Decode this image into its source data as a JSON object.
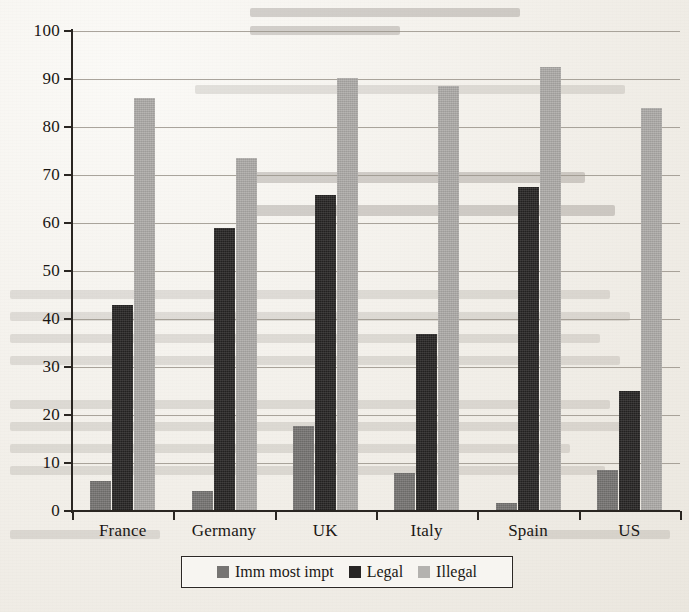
{
  "chart_data": {
    "type": "bar",
    "title": "",
    "subtitle": "",
    "xlabel": "",
    "ylabel": "",
    "categories": [
      "France",
      "Germany",
      "UK",
      "Italy",
      "Spain",
      "US"
    ],
    "series": [
      {
        "name": "Imm most impt",
        "color": "#767472",
        "values": [
          6.3,
          4.2,
          17.7,
          8.0,
          1.7,
          8.5
        ]
      },
      {
        "name": "Legal",
        "color": "#272524",
        "values": [
          43.0,
          59.0,
          65.8,
          36.8,
          67.5,
          25.0
        ]
      },
      {
        "name": "Illegal",
        "color": "#adaba8",
        "values": [
          86.0,
          73.5,
          90.2,
          88.5,
          92.5,
          84.0
        ]
      }
    ],
    "ylim": [
      0,
      100
    ],
    "ytick_values": [
      0,
      10,
      20,
      30,
      40,
      50,
      60,
      70,
      80,
      90,
      100
    ],
    "ytick_labels": [
      "0",
      "10",
      "20",
      "30",
      "40",
      "50",
      "60",
      "70",
      "80",
      "90",
      "100"
    ],
    "grid": true,
    "grid_axis": "y",
    "legend_position": "bottom-center",
    "annotations": []
  },
  "legend": {
    "items": [
      {
        "label": "Imm most impt",
        "swatch": "legend-swatch-imm-most-impt"
      },
      {
        "label": "Legal",
        "swatch": "legend-swatch-legal"
      },
      {
        "label": "Illegal",
        "swatch": "legend-swatch-illegal"
      }
    ]
  },
  "page": {
    "background_color": "#f2efe9",
    "ink_color": "#1a1714",
    "gridline_color": "#9b958c"
  }
}
